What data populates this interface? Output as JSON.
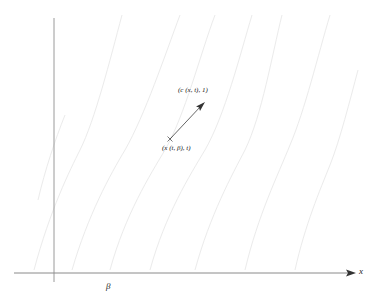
{
  "diagram": {
    "type": "characteristics-plot",
    "axes": {
      "x_label": "x",
      "origin_tick_label": "β"
    },
    "points": {
      "start_label": "(x (t, β), t)",
      "end_label": "(c (x, t), 1)"
    },
    "colors": {
      "axis": "#9a9a9a",
      "curve": "#ececec",
      "arrow": "#444444",
      "text": "#222222"
    },
    "curve_count": 8
  }
}
